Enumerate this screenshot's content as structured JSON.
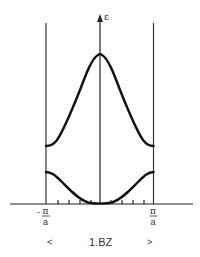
{
  "diagram": {
    "y_axis_label": "ε",
    "x_left_label": {
      "sign": "-",
      "numerator": "π",
      "denominator": "a"
    },
    "x_right_label": {
      "numerator": "π",
      "denominator": "a"
    },
    "zone_label": "1.BZ",
    "zone_left_marker": "<",
    "zone_right_marker": ">",
    "colors": {
      "curve": "#111111",
      "axis": "#222222",
      "boundary": "#333333",
      "text": "#333333"
    },
    "bands": [
      {
        "name": "lower-band",
        "shape": "cosine minimum at center",
        "edge_y": 172,
        "center_y": 204
      },
      {
        "name": "upper-band",
        "shape": "cosine maximum at center",
        "edge_y": 146,
        "center_y": 54
      }
    ],
    "tick_count_per_side": 4
  }
}
